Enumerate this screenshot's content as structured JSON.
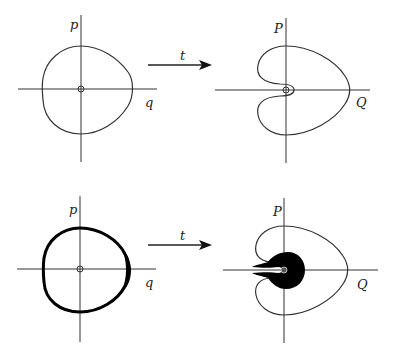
{
  "diagram": {
    "panels": [
      {
        "id": "top-left",
        "vertical_axis": "p",
        "horizontal_axis": "q",
        "description": "closed smooth curve around origin (thin)"
      },
      {
        "id": "top-right",
        "vertical_axis": "P",
        "horizontal_axis": "Q",
        "description": "heart-shaped curve with inward indentation wrapping around origin"
      },
      {
        "id": "bottom-left",
        "vertical_axis": "p",
        "horizontal_axis": "q",
        "description": "thick band curve, thicker on right side"
      },
      {
        "id": "bottom-right",
        "vertical_axis": "P",
        "horizontal_axis": "Q",
        "description": "heart-shaped curve with filled black region around origin"
      }
    ],
    "arrows": [
      {
        "label": "t"
      },
      {
        "label": "t"
      }
    ]
  },
  "colors": {
    "line": "#333333",
    "fill": "#000000",
    "background": "#ffffff"
  }
}
